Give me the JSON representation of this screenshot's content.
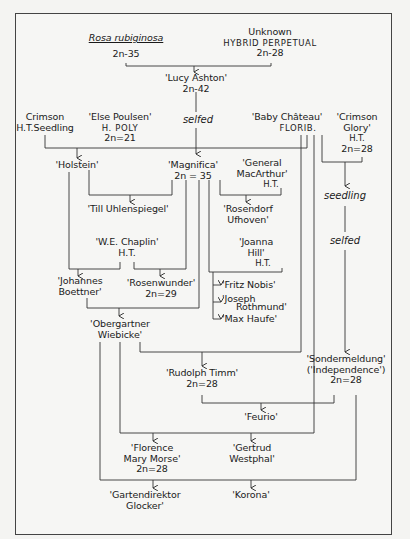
{
  "diagram": {
    "type": "rose-pedigree-chart",
    "nodes": {
      "rosa_rubiginosa": {
        "name": "Rosa rubiginosa",
        "chrom": "2n-35"
      },
      "unknown_hp": {
        "name": "Unknown",
        "class": "HYBRID PERPETUAL",
        "chrom": "2n-28"
      },
      "lucy_ashton": {
        "name": "'Lucy Ashton'",
        "chrom": "2n-42"
      },
      "crimson_seedling": {
        "name": "Crimson",
        "class": "H.T.Seedling"
      },
      "else_poulsen": {
        "name": "'Else Poulsen'",
        "class": "H. POLY",
        "chrom": "2n=21"
      },
      "baby_chateau": {
        "name": "'Baby Château'",
        "class": "FLORIB."
      },
      "crimson_glory": {
        "name": "'Crimson",
        "name2": "Glory'",
        "class": "H.T.",
        "chrom": "2n=28"
      },
      "holstein": {
        "name": "'Holstein'"
      },
      "magnifica": {
        "name": "'Magnifica'",
        "chrom": "2n = 35"
      },
      "general_macarthur": {
        "name": "'General",
        "name2": "MacArthur'",
        "class": "H.T."
      },
      "till_uhlenspiegel": {
        "name": "'Till Uhlenspiegel'"
      },
      "rosendorf_ufhoven": {
        "name": "'Rosendorf",
        "name2": "Ufhoven'"
      },
      "we_chaplin": {
        "name": "'W.E. Chaplin'",
        "class": "H.T."
      },
      "joanna_hill": {
        "name": "'Joanna",
        "name2": "Hill'",
        "class": "H.T."
      },
      "johannes_boettner": {
        "name": "'Johannes",
        "name2": "Boettner'"
      },
      "rosenwunder": {
        "name": "'Rosenwunder'",
        "chrom": "2n=29"
      },
      "fritz_nobis": {
        "name": "'Fritz Nobis'"
      },
      "joseph_rothmund": {
        "name": "'Joseph",
        "name2": "Rothmund'"
      },
      "max_haufe": {
        "name": "'Max Haufe'"
      },
      "obergartner_wiebicke": {
        "name": "'Obergartner",
        "name2": "Wiebicke'"
      },
      "rudolph_timm": {
        "name": "'Rudolph Timm'",
        "chrom": "2n=28"
      },
      "sondermeldung": {
        "name": "'Sondermeldung'",
        "name2": "('Independence')",
        "chrom": "2n=28"
      },
      "feurio": {
        "name": "'Feurio'"
      },
      "florence_mary_morse": {
        "name": "'Florence",
        "name2": "Mary Morse'",
        "chrom": "2n=28"
      },
      "gertrud_westphal": {
        "name": "'Gertrud",
        "name2": "Westphal'"
      },
      "gartendirektor_glocker": {
        "name": "'Gartendirektor",
        "name2": "Glocker'"
      },
      "korona": {
        "name": "'Korona'"
      }
    },
    "edge_labels": {
      "selfed_1": "selfed",
      "seedling": "seedling",
      "selfed_2": "selfed"
    },
    "edges": [
      [
        "Rosa rubiginosa + Unknown HP",
        "Lucy Ashton"
      ],
      [
        "Lucy Ashton (selfed)",
        "Magnifica"
      ],
      [
        "Crimson H.T. Seedling + Else Poulsen",
        "Holstein"
      ],
      [
        "Holstein + Magnifica",
        "Till Uhlenspiegel"
      ],
      [
        "General MacArthur",
        "Rosendorf Ufhoven"
      ],
      [
        "Holstein + W.E. Chaplin",
        "Johannes Boettner"
      ],
      [
        "W.E. Chaplin + Magnifica",
        "Rosenwunder"
      ],
      [
        "Magnifica + Joanna Hill",
        "Fritz Nobis / Joseph Rothmund / Max Haufe"
      ],
      [
        "Johannes Boettner + Magnifica",
        "Obergartner Wiebicke"
      ],
      [
        "Obergartner Wiebicke + Baby Château",
        "Rudolph Timm"
      ],
      [
        "Crimson Glory (seedling, selfed)",
        "Sondermeldung"
      ],
      [
        "Rudolph Timm + Sondermeldung",
        "Feurio"
      ],
      [
        "Obergartner Wiebicke + Baby Château",
        "Florence Mary Morse / Gertrud Westphal"
      ],
      [
        "Obergartner Wiebicke + Sondermeldung",
        "Gartendirektor Glocker / Korona"
      ]
    ]
  }
}
